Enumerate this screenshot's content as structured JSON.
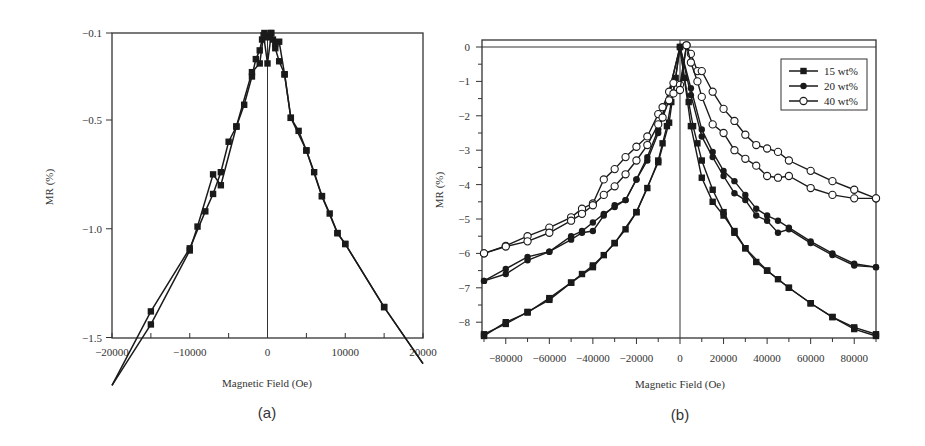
{
  "figure": {
    "panels": [
      "(a)",
      "(b)"
    ]
  },
  "chart_data": [
    {
      "panel": "(a)",
      "type": "line",
      "title": "",
      "xlabel": "Magnetic Field (Oe)",
      "ylabel": "MR (%)",
      "xlim": [
        -20000,
        20000
      ],
      "ylim": [
        -1.75,
        -0.1
      ],
      "x_ticks": [
        -20000,
        -10000,
        0,
        10000,
        20000
      ],
      "x_tick_labels": [
        "−20000",
        "−10000",
        "0",
        "10000",
        "20000"
      ],
      "y_ticks": [
        -0.1,
        -0.5,
        -1.0,
        -1.5
      ],
      "y_tick_labels": [
        "−0.1",
        "−0.5",
        "−1.0",
        "−1.5"
      ],
      "grid": false,
      "legend": null,
      "marker": "filled-square",
      "series": [
        {
          "name": "sweep down",
          "x": [
            -20000,
            -15000,
            -10000,
            -8000,
            -7000,
            -6000,
            -5000,
            -4000,
            -3000,
            -2000,
            -1500,
            -1000,
            -700,
            -400,
            0,
            400,
            700,
            1000,
            1500,
            2200,
            3000,
            4000,
            5000,
            6000,
            7000,
            8000,
            9000,
            10000,
            15000,
            20000
          ],
          "y": [
            -1.72,
            -1.38,
            -1.09,
            -0.92,
            -0.84,
            -0.74,
            -0.6,
            -0.53,
            -0.43,
            -0.3,
            -0.22,
            -0.18,
            -0.13,
            -0.1,
            -0.12,
            -0.1,
            -0.13,
            -0.17,
            -0.23,
            -0.29,
            -0.49,
            -0.55,
            -0.64,
            -0.74,
            -0.85,
            -0.93,
            -1.02,
            -1.07,
            -1.36,
            -1.62
          ]
        },
        {
          "name": "sweep up",
          "x": [
            -20000,
            -15000,
            -10000,
            -9000,
            -7000,
            -6000,
            -4000,
            -2000,
            -1000,
            -500,
            0,
            500,
            1000,
            1500,
            2200,
            3000,
            5000,
            7000,
            9000,
            10000,
            15000,
            20000
          ],
          "y": [
            -1.72,
            -1.44,
            -1.1,
            -0.99,
            -0.75,
            -0.8,
            -0.53,
            -0.28,
            -0.24,
            -0.11,
            -0.24,
            -0.1,
            -0.15,
            -0.14,
            -0.29,
            -0.49,
            -0.64,
            -0.85,
            -1.02,
            -1.07,
            -1.36,
            -1.62
          ]
        }
      ]
    },
    {
      "panel": "(b)",
      "type": "line",
      "title": "",
      "xlabel": "Magnetic Field (Oe)",
      "ylabel": "MR (%)",
      "xlim": [
        -90000,
        90000
      ],
      "ylim": [
        -8.5,
        0.3
      ],
      "x_ticks": [
        -80000,
        -60000,
        -40000,
        -20000,
        0,
        20000,
        40000,
        60000,
        80000
      ],
      "x_tick_labels": [
        "−80000",
        "−60000",
        "−40000",
        "−20000",
        "0",
        "20000",
        "40000",
        "60000",
        "80000"
      ],
      "y_ticks": [
        0,
        -1,
        -2,
        -3,
        -4,
        -5,
        -6,
        -7,
        -8
      ],
      "y_tick_labels": [
        "0",
        "−1",
        "−2",
        "−3",
        "−4",
        "−5",
        "−6",
        "−7",
        "−8"
      ],
      "grid": false,
      "legend": {
        "position": "upper right",
        "entries": [
          {
            "label": "15 wt%",
            "marker": "filled-square"
          },
          {
            "label": "20 wt%",
            "marker": "filled-circle"
          },
          {
            "label": "40 wt%",
            "marker": "open-circle"
          }
        ]
      },
      "series": [
        {
          "name": "15 wt%",
          "marker": "filled-square",
          "branches": [
            {
              "x": [
                -90000,
                -80000,
                -70000,
                -60000,
                -50000,
                -45000,
                -40000,
                -35000,
                -30000,
                -25000,
                -20000,
                -15000,
                -10000,
                -8000,
                -6000,
                -4000,
                -2000,
                0,
                2000,
                4000,
                6000,
                8000,
                10000,
                15000,
                20000,
                25000,
                30000,
                35000,
                40000,
                45000,
                50000,
                60000,
                70000,
                80000,
                90000
              ],
              "y": [
                -8.35,
                -8.05,
                -7.7,
                -7.35,
                -6.85,
                -6.6,
                -6.35,
                -6.05,
                -5.7,
                -5.3,
                -4.8,
                -4.1,
                -3.3,
                -2.8,
                -2.3,
                -1.6,
                -0.9,
                0,
                -0.9,
                -1.6,
                -2.3,
                -2.8,
                -3.3,
                -4.15,
                -4.8,
                -5.4,
                -5.85,
                -6.25,
                -6.5,
                -6.75,
                -7.0,
                -7.45,
                -7.85,
                -8.2,
                -8.4
              ]
            },
            {
              "x": [
                -90000,
                -80000,
                -70000,
                -60000,
                -50000,
                -40000,
                -30000,
                -20000,
                -10000,
                -5000,
                0,
                5000,
                10000,
                15000,
                20000,
                25000,
                30000,
                40000,
                50000,
                60000,
                70000,
                80000,
                90000
              ],
              "y": [
                -8.4,
                -8.0,
                -7.72,
                -7.3,
                -6.85,
                -6.4,
                -5.7,
                -4.8,
                -3.35,
                -2.2,
                0,
                -2.3,
                -3.8,
                -4.5,
                -4.9,
                -5.35,
                -5.85,
                -6.5,
                -7.0,
                -7.45,
                -7.85,
                -8.15,
                -8.35
              ]
            }
          ]
        },
        {
          "name": "20 wt%",
          "marker": "filled-circle",
          "branches": [
            {
              "x": [
                -90000,
                -80000,
                -70000,
                -60000,
                -50000,
                -45000,
                -40000,
                -35000,
                -30000,
                -25000,
                -20000,
                -15000,
                -10000,
                -5000,
                0,
                5000,
                10000,
                15000,
                20000,
                25000,
                30000,
                35000,
                40000,
                45000,
                50000,
                60000,
                70000,
                80000,
                90000
              ],
              "y": [
                -6.8,
                -6.45,
                -6.1,
                -5.95,
                -5.5,
                -5.35,
                -5.1,
                -4.85,
                -4.65,
                -4.45,
                -3.85,
                -3.2,
                -2.4,
                -1.3,
                0,
                -1.2,
                -2.4,
                -3.05,
                -3.6,
                -3.9,
                -4.3,
                -4.7,
                -4.9,
                -5.05,
                -5.25,
                -5.65,
                -6.0,
                -6.3,
                -6.4
              ]
            },
            {
              "x": [
                -90000,
                -80000,
                -70000,
                -60000,
                -50000,
                -45000,
                -40000,
                -35000,
                -30000,
                -25000,
                -20000,
                -15000,
                -10000,
                -5000,
                0,
                5000,
                10000,
                15000,
                20000,
                25000,
                30000,
                35000,
                40000,
                45000,
                50000,
                60000,
                70000,
                80000,
                90000
              ],
              "y": [
                -6.8,
                -6.6,
                -6.2,
                -5.95,
                -5.6,
                -5.4,
                -5.35,
                -4.9,
                -4.6,
                -4.45,
                -3.85,
                -3.3,
                -2.5,
                -1.3,
                0,
                -1.4,
                -2.6,
                -3.2,
                -3.75,
                -4.25,
                -4.45,
                -4.9,
                -5.05,
                -5.4,
                -5.3,
                -5.7,
                -6.05,
                -6.35,
                -6.4
              ]
            }
          ]
        },
        {
          "name": "40 wt%",
          "marker": "open-circle",
          "branches": [
            {
              "x": [
                -90000,
                -80000,
                -70000,
                -60000,
                -50000,
                -45000,
                -40000,
                -35000,
                -30000,
                -25000,
                -20000,
                -15000,
                -10000,
                -8000,
                -5000,
                -3000,
                0,
                3000,
                5000,
                8000,
                10000,
                15000,
                20000,
                25000,
                30000,
                35000,
                40000,
                45000,
                50000,
                60000,
                70000,
                80000,
                90000
              ],
              "y": [
                -6.0,
                -5.78,
                -5.5,
                -5.25,
                -4.95,
                -4.7,
                -4.55,
                -3.85,
                -3.55,
                -3.2,
                -2.9,
                -2.6,
                -1.95,
                -1.75,
                -1.3,
                -1.05,
                -1.1,
                0.05,
                -0.2,
                -0.7,
                -0.7,
                -1.3,
                -1.8,
                -2.15,
                -2.55,
                -2.85,
                -2.95,
                -3.05,
                -3.3,
                -3.6,
                -3.9,
                -4.15,
                -4.4
              ]
            },
            {
              "x": [
                -90000,
                -80000,
                -70000,
                -60000,
                -50000,
                -45000,
                -40000,
                -35000,
                -30000,
                -25000,
                -20000,
                -15000,
                -10000,
                -8000,
                -5000,
                -3000,
                0,
                3000,
                5000,
                8000,
                10000,
                15000,
                20000,
                25000,
                30000,
                35000,
                40000,
                45000,
                50000,
                60000,
                70000,
                80000,
                90000
              ],
              "y": [
                -6.0,
                -5.8,
                -5.65,
                -5.4,
                -5.05,
                -4.85,
                -4.6,
                -4.3,
                -4.05,
                -3.7,
                -3.3,
                -2.85,
                -2.25,
                -2.05,
                -1.55,
                -1.35,
                -1.25,
                0.05,
                -0.45,
                -1.0,
                -1.45,
                -2.25,
                -2.5,
                -3.0,
                -3.25,
                -3.45,
                -3.75,
                -3.8,
                -3.75,
                -4.1,
                -4.3,
                -4.4,
                -4.4
              ]
            }
          ]
        }
      ]
    }
  ]
}
